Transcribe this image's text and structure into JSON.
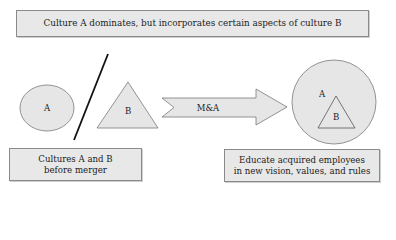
{
  "title_box": {
    "text": "Culture A dominates, but incorporates certain aspects of culture B"
  },
  "before": {
    "shape_a_label": "A",
    "shape_b_label": "B",
    "caption_line1": "Cultures A and B",
    "caption_line2": "before merger"
  },
  "arrow": {
    "label": "M&A"
  },
  "after": {
    "outer_label": "A",
    "inner_label": "B",
    "caption_line1": "Educate acquired employees",
    "caption_line2": "in new vision, values, and rules"
  },
  "colors": {
    "fill": "#e6e6e6",
    "stroke": "#7a7a7a",
    "divider": "#111111"
  }
}
